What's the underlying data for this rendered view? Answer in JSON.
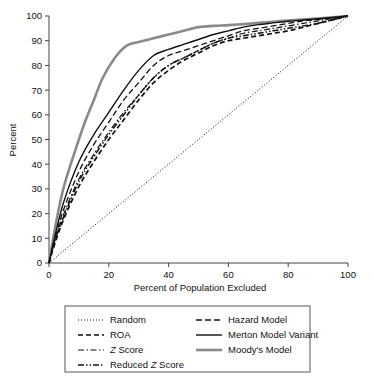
{
  "chart_data": {
    "type": "line",
    "title": "",
    "xlabel": "Percent of Population Excluded",
    "ylabel": "Percent",
    "xlim": [
      0,
      100
    ],
    "ylim": [
      0,
      100
    ],
    "xticks": [
      0,
      20,
      40,
      60,
      80,
      100
    ],
    "yticks": [
      0,
      10,
      20,
      30,
      40,
      50,
      60,
      70,
      80,
      90,
      100
    ],
    "grid": false,
    "legend_position": "below-plot",
    "legend_columns": 2,
    "series": [
      {
        "name": "Random",
        "style": "dotted",
        "color": "#111111",
        "x": [
          0,
          100
        ],
        "y": [
          0,
          100
        ]
      },
      {
        "name": "ROA",
        "style": "dashed",
        "color": "#111111",
        "x": [
          0,
          2,
          5,
          10,
          15,
          20,
          25,
          30,
          35,
          40,
          45,
          50,
          55,
          60,
          65,
          70,
          75,
          80,
          85,
          90,
          95,
          100
        ],
        "y": [
          0,
          8,
          18,
          31,
          41,
          50,
          58,
          66,
          73,
          78,
          82,
          85,
          88,
          90,
          91,
          92,
          93,
          94,
          95.5,
          97,
          98.5,
          100
        ]
      },
      {
        "name": "Z Score",
        "style": "dash-dot",
        "color": "#111111",
        "x": [
          0,
          2,
          5,
          10,
          15,
          20,
          25,
          30,
          35,
          40,
          45,
          50,
          55,
          60,
          65,
          70,
          75,
          80,
          85,
          90,
          95,
          100
        ],
        "y": [
          0,
          9,
          20,
          34,
          44,
          53,
          61,
          68,
          75,
          80,
          83,
          86,
          89,
          91,
          93,
          94,
          95,
          96,
          97,
          98,
          99,
          100
        ]
      },
      {
        "name": "Reduced Z Score",
        "style": "dash-dot-dot",
        "color": "#111111",
        "x": [
          0,
          2,
          5,
          10,
          15,
          20,
          25,
          30,
          35,
          40,
          45,
          50,
          55,
          60,
          65,
          70,
          75,
          80,
          85,
          90,
          95,
          100
        ],
        "y": [
          0,
          9,
          19,
          33,
          43,
          52,
          60,
          68,
          75,
          80,
          83,
          86,
          89,
          91,
          92,
          93,
          94,
          95,
          96,
          97,
          98.5,
          100
        ]
      },
      {
        "name": "Hazard Model",
        "style": "dashed-long",
        "color": "#111111",
        "x": [
          0,
          2,
          5,
          10,
          15,
          20,
          25,
          30,
          35,
          40,
          45,
          50,
          55,
          60,
          65,
          70,
          75,
          80,
          85,
          90,
          95,
          100
        ],
        "y": [
          0,
          10,
          22,
          37,
          48,
          57,
          66,
          73,
          80,
          84,
          86,
          88,
          90,
          92,
          94,
          95,
          96,
          97,
          98,
          98.6,
          99.3,
          100
        ]
      },
      {
        "name": "Merton Model Variant",
        "style": "solid",
        "color": "#111111",
        "x": [
          0,
          2,
          5,
          10,
          15,
          20,
          25,
          30,
          35,
          40,
          45,
          50,
          55,
          60,
          65,
          70,
          75,
          80,
          85,
          90,
          95,
          100
        ],
        "y": [
          0,
          11,
          25,
          41,
          52,
          61,
          70,
          78,
          84,
          86.5,
          88.5,
          90.5,
          92.5,
          94,
          95.5,
          96.5,
          97.2,
          97.9,
          98.4,
          98.9,
          99.4,
          100
        ]
      },
      {
        "name": "Moody's Model",
        "style": "solid-gray",
        "color": "#8a8a8a",
        "x": [
          0,
          2,
          5,
          10,
          12,
          15,
          18,
          22,
          26,
          30,
          35,
          40,
          45,
          50,
          55,
          60,
          65,
          70,
          75,
          80,
          85,
          90,
          95,
          100
        ],
        "y": [
          0,
          14,
          31,
          50,
          57,
          66,
          75,
          83,
          88,
          89.5,
          91,
          92.5,
          94,
          95.5,
          96,
          96.3,
          96.7,
          97.2,
          97.7,
          98.2,
          98.6,
          99,
          99.5,
          100
        ]
      }
    ]
  },
  "legend": {
    "column_left": [
      {
        "label": "Random",
        "style": "dotted",
        "italic_prefix": ""
      },
      {
        "label": "ROA",
        "style": "dashed",
        "italic_prefix": ""
      },
      {
        "label": "Score",
        "style": "dash-dot",
        "italic_prefix": "Z"
      },
      {
        "label": "Score",
        "style": "dash-dot-dot",
        "italic_prefix": "Reduced Z"
      }
    ],
    "column_right": [
      {
        "label": "Hazard Model",
        "style": "dashed-long",
        "italic_prefix": ""
      },
      {
        "label": "Merton Model Variant",
        "style": "solid",
        "italic_prefix": ""
      },
      {
        "label": "Moody's Model",
        "style": "solid-gray",
        "italic_prefix": ""
      }
    ]
  },
  "axes": {
    "x_title": "Percent of Population Excluded",
    "y_title": "Percent",
    "x_tick_labels": [
      "0",
      "20",
      "40",
      "60",
      "80",
      "100"
    ],
    "y_tick_labels": [
      "0",
      "10",
      "20",
      "30",
      "40",
      "50",
      "60",
      "70",
      "80",
      "90",
      "100"
    ]
  },
  "colors": {
    "line_black": "#111111",
    "line_gray": "#8a8a8a",
    "axis": "#444444",
    "legend_border": "#666666",
    "background": "#ffffff"
  }
}
